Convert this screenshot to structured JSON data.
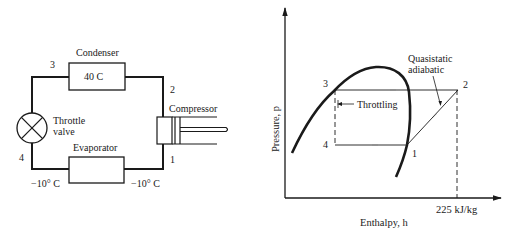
{
  "cycle_diagram": {
    "condenser": {
      "title": "Condenser",
      "temperature": "40 C"
    },
    "evaporator": {
      "title": "Evaporator"
    },
    "throttle_valve": {
      "line1": "Throttle",
      "line2": "valve"
    },
    "compressor": {
      "title": "Compressor"
    },
    "state_points": {
      "p1": "1",
      "p2": "2",
      "p3": "3",
      "p4": "4"
    },
    "temp_evap_in": "−10° C",
    "temp_evap_out": "−10° C"
  },
  "ph_chart": {
    "y_axis_label": "Pressure, p",
    "x_axis_label": "Enthalpy, h",
    "x_tick_label": "225 kJ/kg",
    "annotation_compression_line1": "Quasistatic",
    "annotation_compression_line2": "adiabatic",
    "annotation_throttling": "Throttling",
    "state_points": {
      "p1": "1",
      "p2": "2",
      "p3": "3",
      "p4": "4"
    }
  },
  "colors": {
    "line": "#1a1a1a",
    "background": "#ffffff"
  }
}
